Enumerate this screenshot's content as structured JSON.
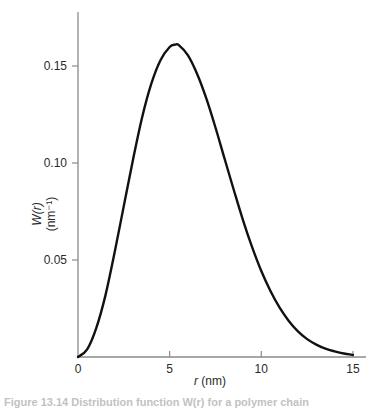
{
  "chart_data": {
    "type": "line",
    "title": "",
    "xlabel": "r (nm)",
    "xlabel_var": "r",
    "xlabel_unit": " (nm)",
    "ylabel_line1": "W(r)",
    "ylabel_line2": "(nm⁻¹)",
    "xlim": [
      0,
      15.8
    ],
    "ylim": [
      0,
      0.178
    ],
    "xticks": [
      0,
      5,
      10,
      15
    ],
    "xtick_labels": [
      "0",
      "5",
      "10",
      "15"
    ],
    "yticks": [
      0.05,
      0.1,
      0.15
    ],
    "ytick_labels": [
      "0.05",
      "0.10",
      "0.15"
    ],
    "grid": false,
    "legend": null,
    "series": [
      {
        "name": "W(r)",
        "color": "#111111",
        "x": [
          0,
          0.5,
          1,
          1.5,
          2,
          2.5,
          3,
          3.5,
          4,
          4.5,
          5,
          5.3,
          5.5,
          6,
          6.5,
          7,
          7.5,
          8,
          8.5,
          9,
          9.5,
          10,
          10.5,
          11,
          11.5,
          12,
          12.5,
          13,
          13.5,
          14,
          14.5,
          15
        ],
        "y": [
          0,
          0.0039,
          0.015,
          0.0319,
          0.054,
          0.0779,
          0.1017,
          0.1236,
          0.1409,
          0.153,
          0.1598,
          0.161,
          0.1608,
          0.1555,
          0.1459,
          0.1333,
          0.1183,
          0.1021,
          0.0861,
          0.0706,
          0.0566,
          0.0443,
          0.034,
          0.0254,
          0.0186,
          0.0132,
          0.0092,
          0.0064,
          0.0043,
          0.0029,
          0.0018,
          0.0011
        ]
      }
    ]
  },
  "caption": {
    "text": "Figure 13.14  Distribution function W(r) for a polymer chain"
  }
}
